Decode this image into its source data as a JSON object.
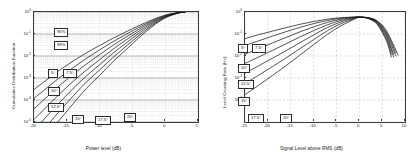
{
  "figure": {
    "background_color": "#ffffff",
    "axis_color": "#3a3a3a",
    "curve_color": "#1a1a1a",
    "grid_color": "#aaaaaa"
  },
  "chart_data": [
    {
      "type": "line",
      "title": "",
      "xlabel": "Power level (dB)",
      "ylabel": "Cumulative Distribution Function",
      "xlim": [
        -20,
        5
      ],
      "ylim_log": [
        -5,
        0
      ],
      "xticks": [
        "-20",
        "-15",
        "-10",
        "-5",
        "0",
        "5"
      ],
      "xtick_values": [
        -20,
        -15,
        -10,
        -5,
        0,
        5
      ],
      "yticks": [
        "10",
        "10",
        "10",
        "10",
        "10",
        "10"
      ],
      "ytick_exponents": [
        "0",
        "-1",
        "-2",
        "-3",
        "-4",
        "-5"
      ],
      "yscale": "log",
      "grid": true,
      "grid_style": "minor-log",
      "legend_position": "inline-annotations",
      "annotations": [
        {
          "label": "95%",
          "x_px": 54,
          "y_px": 28
        },
        {
          "label": "99%",
          "x_px": 54,
          "y_px": 41
        },
        {
          "label": "5°",
          "x_px": 48,
          "y_px": 69
        },
        {
          "label": "7.5°",
          "x_px": 63,
          "y_px": 69
        },
        {
          "label": "10°",
          "x_px": 48,
          "y_px": 87
        },
        {
          "label": "12.5°",
          "x_px": 48,
          "y_px": 103
        },
        {
          "label": "15°",
          "x_px": 72,
          "y_px": 115
        },
        {
          "label": "17.5°",
          "x_px": 95,
          "y_px": 116
        },
        {
          "label": "20°",
          "x_px": 124,
          "y_px": 113
        }
      ],
      "series": [
        {
          "name": "5°",
          "x": [
            -20,
            -18,
            -16,
            -14,
            -12,
            -10,
            -8,
            -6,
            -4,
            -2,
            0,
            2,
            3
          ],
          "y": [
            0.0003,
            0.00085,
            0.0024,
            0.006,
            0.014,
            0.03,
            0.063,
            0.125,
            0.24,
            0.44,
            0.72,
            0.95,
            0.995
          ]
        },
        {
          "name": "7.5°",
          "x": [
            -20,
            -18,
            -16,
            -14,
            -12,
            -10,
            -8,
            -6,
            -4,
            -2,
            0,
            2,
            3
          ],
          "y": [
            0.00012,
            0.00036,
            0.0011,
            0.003,
            0.0078,
            0.019,
            0.044,
            0.096,
            0.2,
            0.395,
            0.685,
            0.94,
            0.993
          ]
        },
        {
          "name": "10°",
          "x": [
            -20,
            -18,
            -16,
            -14,
            -12,
            -10,
            -8,
            -6,
            -4,
            -2,
            0,
            2,
            3
          ],
          "y": [
            4e-05,
            0.00014,
            0.00048,
            0.0015,
            0.0043,
            0.0115,
            0.03,
            0.072,
            0.165,
            0.355,
            0.655,
            0.93,
            0.992
          ]
        },
        {
          "name": "12.5°",
          "x": [
            -20,
            -18,
            -16,
            -14,
            -12,
            -10,
            -8,
            -6,
            -4,
            -2,
            0,
            2,
            3
          ],
          "y": [
            1.3e-05,
            5.2e-05,
            0.0002,
            0.00072,
            0.0023,
            0.0068,
            0.02,
            0.053,
            0.134,
            0.315,
            0.625,
            0.92,
            0.991
          ]
        },
        {
          "name": "15°",
          "x": [
            -20,
            -18,
            -16,
            -14,
            -12,
            -10,
            -8,
            -6,
            -4,
            -2,
            0,
            2,
            3
          ],
          "y": [
            4.2e-06,
            1.9e-05,
            8.3e-05,
            0.00034,
            0.00125,
            0.004,
            0.013,
            0.038,
            0.108,
            0.278,
            0.595,
            0.91,
            0.99
          ]
        },
        {
          "name": "17.5°",
          "x": [
            -20,
            -18,
            -16,
            -14,
            -12,
            -10,
            -8,
            -6,
            -4,
            -2,
            0,
            2,
            3
          ],
          "y": [
            1.4e-06,
            6.9e-06,
            3.4e-05,
            0.000155,
            0.00066,
            0.0023,
            0.0084,
            0.027,
            0.086,
            0.245,
            0.565,
            0.9,
            0.989
          ]
        },
        {
          "name": "20°",
          "x": [
            -20,
            -18,
            -16,
            -14,
            -12,
            -10,
            -8,
            -6,
            -4,
            -2,
            0,
            2,
            3
          ],
          "y": [
            4.5e-07,
            2.5e-06,
            1.35e-05,
            7e-05,
            0.00034,
            0.0013,
            0.0054,
            0.019,
            0.068,
            0.215,
            0.535,
            0.89,
            0.988
          ]
        }
      ]
    },
    {
      "type": "line",
      "title": "",
      "xlabel": "Signal Level above RMS (dB)",
      "ylabel": "Level Crossing Rate (Hz)",
      "xlim": [
        -25,
        10
      ],
      "ylim_log": [
        -4,
        1
      ],
      "xticks": [
        "-25",
        "-20",
        "-15",
        "-10",
        "-5",
        "0",
        "5",
        "10"
      ],
      "xtick_values": [
        -25,
        -20,
        -15,
        -10,
        -5,
        0,
        5,
        10
      ],
      "yticks": [
        "10",
        "10",
        "10",
        "10",
        "10"
      ],
      "ytick_exponents": [
        "0",
        "-1",
        "-2",
        "-3",
        "-4"
      ],
      "yscale": "log",
      "grid": true,
      "grid_style": "dashed",
      "legend_position": "inline-annotations",
      "annotations": [
        {
          "label": "5°",
          "x_px": 238,
          "y_px": 44
        },
        {
          "label": "7.5°",
          "x_px": 252,
          "y_px": 44
        },
        {
          "label": "10°",
          "x_px": 238,
          "y_px": 64
        },
        {
          "label": "12.5°",
          "x_px": 238,
          "y_px": 80
        },
        {
          "label": "15°",
          "x_px": 238,
          "y_px": 97
        },
        {
          "label": "17.5°",
          "x_px": 248,
          "y_px": 114
        },
        {
          "label": "20°",
          "x_px": 280,
          "y_px": 114
        }
      ],
      "series": [
        {
          "name": "5°",
          "x": [
            -25,
            -22,
            -19,
            -16,
            -13,
            -10,
            -7,
            -4,
            -1,
            0,
            2,
            4,
            6,
            7
          ],
          "y": [
            0.62,
            0.93,
            1.35,
            1.95,
            2.75,
            3.7,
            4.7,
            5.5,
            5.9,
            5.9,
            5.0,
            2.6,
            0.45,
            0.09
          ]
        },
        {
          "name": "7.5°",
          "x": [
            -25,
            -22,
            -19,
            -16,
            -13,
            -10,
            -7,
            -4,
            -1,
            0,
            2,
            4,
            6,
            7
          ],
          "y": [
            0.3,
            0.49,
            0.8,
            1.28,
            2.0,
            2.95,
            4.1,
            5.2,
            5.85,
            5.9,
            5.1,
            2.85,
            0.55,
            0.12
          ]
        },
        {
          "name": "10°",
          "x": [
            -25,
            -22,
            -19,
            -16,
            -13,
            -10,
            -7,
            -4,
            -1,
            0,
            2,
            4,
            6,
            7.5
          ],
          "y": [
            0.12,
            0.215,
            0.39,
            0.7,
            1.25,
            2.1,
            3.35,
            4.7,
            5.7,
            5.88,
            5.2,
            3.05,
            0.68,
            0.09
          ]
        },
        {
          "name": "12.5°",
          "x": [
            -25,
            -22,
            -19,
            -16,
            -13,
            -10,
            -7,
            -4,
            -1,
            0,
            2,
            4,
            6,
            7.5
          ],
          "y": [
            0.046,
            0.09,
            0.18,
            0.36,
            0.73,
            1.42,
            2.6,
            4.15,
            5.55,
            5.85,
            5.3,
            3.25,
            0.82,
            0.12
          ]
        },
        {
          "name": "15°",
          "x": [
            -25,
            -22,
            -19,
            -16,
            -13,
            -10,
            -7,
            -4,
            -1,
            0,
            2,
            4,
            6,
            8
          ],
          "y": [
            0.0165,
            0.036,
            0.079,
            0.175,
            0.4,
            0.9,
            1.95,
            3.55,
            5.35,
            5.8,
            5.38,
            3.45,
            0.98,
            0.1
          ]
        },
        {
          "name": "17.5°",
          "x": [
            -25,
            -22,
            -19,
            -16,
            -13,
            -10,
            -7,
            -4,
            -1,
            0,
            2,
            4,
            6,
            8
          ],
          "y": [
            0.0056,
            0.0135,
            0.033,
            0.082,
            0.215,
            0.55,
            1.4,
            2.95,
            5.1,
            5.72,
            5.45,
            3.65,
            1.15,
            0.14
          ]
        },
        {
          "name": "20°",
          "x": [
            -25,
            -22,
            -19,
            -16,
            -13,
            -10,
            -7,
            -4,
            -1,
            0,
            2,
            4,
            6,
            8.5
          ],
          "y": [
            0.00175,
            0.0047,
            0.013,
            0.0365,
            0.11,
            0.325,
            0.96,
            2.35,
            4.8,
            5.62,
            5.5,
            3.85,
            1.35,
            0.11
          ]
        }
      ]
    }
  ]
}
